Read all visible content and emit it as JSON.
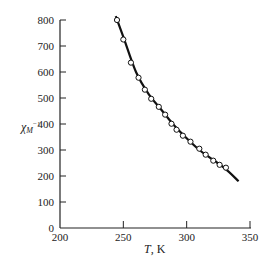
{
  "chart_data": {
    "type": "scatter",
    "title": "",
    "xlabel": "T, K",
    "ylabel": "χM⁻¹",
    "xlim": [
      200,
      350
    ],
    "ylim": [
      0,
      800
    ],
    "x_ticks": [
      200,
      250,
      300,
      350
    ],
    "y_ticks": [
      0,
      100,
      200,
      300,
      400,
      500,
      600,
      700,
      800
    ],
    "grid": false,
    "legend": null,
    "series": [
      {
        "name": "experimental",
        "marker": "open-circle",
        "x": [
          245,
          250,
          256,
          262,
          267,
          272,
          278,
          283,
          288,
          292,
          297,
          303,
          310,
          315,
          321,
          326,
          331
        ],
        "values": [
          800,
          725,
          636,
          578,
          532,
          497,
          466,
          436,
          401,
          378,
          355,
          332,
          305,
          282,
          259,
          243,
          232
        ]
      },
      {
        "name": "fit",
        "style": "solid-line",
        "x": [
          244,
          250,
          260,
          270,
          280,
          290,
          300,
          310,
          320,
          330,
          341
        ],
        "values": [
          815,
          735,
          600,
          515,
          455,
          395,
          345,
          300,
          265,
          230,
          180
        ]
      }
    ]
  },
  "axes": {
    "x_tick_labels": [
      "200",
      "250",
      "300",
      "350"
    ],
    "y_tick_labels": [
      "0",
      "100",
      "200",
      "300",
      "400",
      "500",
      "600",
      "700",
      "800"
    ],
    "x_title_italic": "T",
    "x_title_rest": ", K",
    "y_title_main": "χ",
    "y_title_sub": "M",
    "y_title_sup": "−1"
  }
}
